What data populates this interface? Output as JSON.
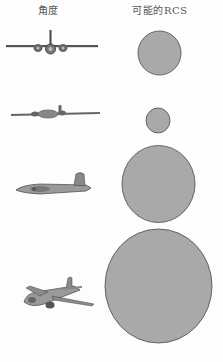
{
  "header": {
    "angle_label": "角度",
    "rcs_label": "可能的RCS"
  },
  "colors": {
    "circle_fill": "#a9a9a9",
    "circle_stroke": "#4a4a4a",
    "aircraft_fill": "#8c8c8c",
    "aircraft_dark": "#3c3c3c",
    "background": "#fdfdfd"
  },
  "rows": [
    {
      "aircraft_view": "front view",
      "rcs_circle": {
        "cx": 159.5,
        "cy": 53,
        "rx": 21.5,
        "ry": 22
      }
    },
    {
      "aircraft_view": "nose-on slightly banked view",
      "rcs_circle": {
        "cx": 158,
        "cy": 120.5,
        "rx": 12,
        "ry": 12.5
      }
    },
    {
      "aircraft_view": "side view",
      "rcs_circle": {
        "cx": 158.5,
        "cy": 184,
        "rx": 36.5,
        "ry": 38.5
      }
    },
    {
      "aircraft_view": "oblique front-quarter view",
      "rcs_circle": {
        "cx": 158.5,
        "cy": 286,
        "rx": 53.5,
        "ry": 57
      }
    }
  ]
}
